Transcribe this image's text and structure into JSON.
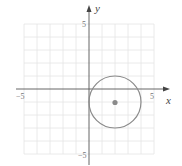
{
  "diagram": {
    "type": "circle-on-coordinate-plane",
    "axes": {
      "x_label": "x",
      "y_label": "y"
    },
    "ticks": {
      "x_min": "−5",
      "x_max": "5",
      "y_max": "5",
      "y_min": "−5"
    },
    "grid": {
      "range": [
        -5,
        5
      ],
      "step": 1
    },
    "circle": {
      "center": [
        2,
        -1
      ],
      "radius": 2
    },
    "colors": {
      "grid": "#e4e4e4",
      "axes": "#555555",
      "circle": "#8a8a8a",
      "center_dot": "#8a8a8a"
    }
  }
}
